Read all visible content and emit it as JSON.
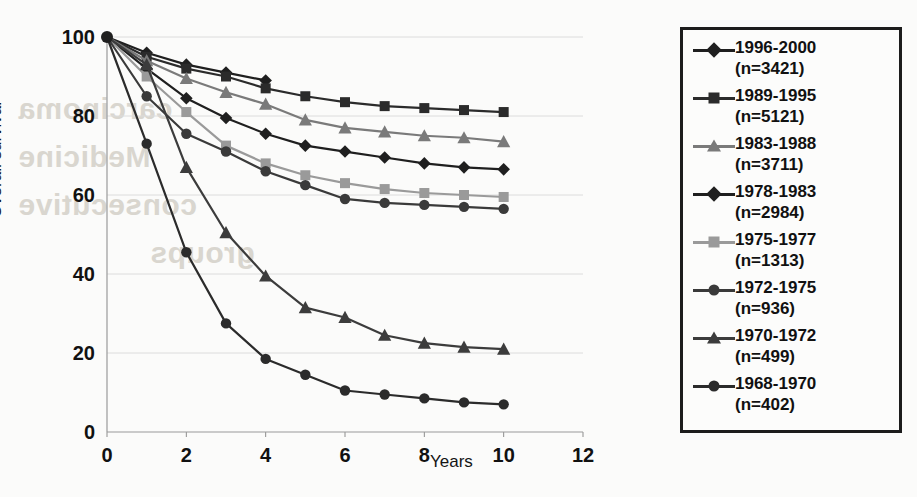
{
  "chart_data": {
    "type": "line",
    "title": "",
    "xlabel": "Years",
    "ylabel": "Overall survival",
    "xlim": [
      0,
      12
    ],
    "ylim": [
      0,
      100
    ],
    "xticks": [
      "0",
      "2",
      "4",
      "6",
      "8",
      "10",
      "12"
    ],
    "yticks": [
      "0",
      "20",
      "40",
      "60",
      "80",
      "100"
    ],
    "grid": true,
    "legend_position": "right-outside",
    "series": [
      {
        "name": "1996-2000",
        "n_label": "(n=3421)",
        "marker": "diamond",
        "color": "#1f1f1f",
        "x": [
          0,
          1,
          2,
          3,
          4
        ],
        "values": [
          100,
          96,
          93,
          91,
          89
        ]
      },
      {
        "name": "1989-1995",
        "n_label": "(n=5121)",
        "marker": "square",
        "color": "#2b2b2b",
        "x": [
          0,
          1,
          2,
          3,
          4,
          5,
          6,
          7,
          8,
          9,
          10
        ],
        "values": [
          100,
          95,
          92,
          90,
          87,
          85,
          83.5,
          82.5,
          82,
          81.5,
          81
        ]
      },
      {
        "name": "1983-1988",
        "n_label": "(n=3711)",
        "marker": "triangle",
        "color": "#7a7a7a",
        "x": [
          0,
          1,
          2,
          3,
          4,
          5,
          6,
          7,
          8,
          9,
          10
        ],
        "values": [
          100,
          94,
          89.5,
          86,
          83,
          79,
          77,
          76,
          75,
          74.5,
          73.5
        ]
      },
      {
        "name": "1978-1983",
        "n_label": "(n=2984)",
        "marker": "diamond",
        "color": "#1f1f1f",
        "x": [
          0,
          1,
          2,
          3,
          4,
          5,
          6,
          7,
          8,
          9,
          10
        ],
        "values": [
          100,
          92,
          84.5,
          79.5,
          75.5,
          72.5,
          71,
          69.5,
          68,
          67,
          66.5
        ]
      },
      {
        "name": "1975-1977",
        "n_label": "(n=1313)",
        "marker": "square",
        "color": "#9a9a9a",
        "x": [
          0,
          1,
          2,
          3,
          4,
          5,
          6,
          7,
          8,
          9,
          10
        ],
        "values": [
          100,
          90,
          81,
          72.5,
          68,
          65,
          63,
          61.5,
          60.5,
          60,
          59.5
        ]
      },
      {
        "name": "1972-1975",
        "n_label": "(n=936)",
        "marker": "circle",
        "color": "#3a3a3a",
        "x": [
          0,
          1,
          2,
          3,
          4,
          5,
          6,
          7,
          8,
          9,
          10
        ],
        "values": [
          100,
          85,
          75.5,
          71,
          66,
          62.5,
          59,
          58,
          57.5,
          57,
          56.5
        ]
      },
      {
        "name": "1970-1972",
        "n_label": "(n=499)",
        "marker": "triangle",
        "color": "#3c3c3c",
        "x": [
          0,
          1,
          2,
          3,
          4,
          5,
          6,
          7,
          8,
          9,
          10
        ],
        "values": [
          100,
          93,
          67,
          50.5,
          39.5,
          31.5,
          29,
          24.5,
          22.5,
          21.5,
          21
        ]
      },
      {
        "name": "1968-1970",
        "n_label": "(n=402)",
        "marker": "circle",
        "color": "#2b2b2b",
        "x": [
          0,
          1,
          2,
          3,
          4,
          5,
          6,
          7,
          8,
          9,
          10
        ],
        "values": [
          100,
          73,
          45.5,
          27.5,
          18.5,
          14.5,
          10.5,
          9.5,
          8.5,
          7.5,
          7
        ]
      }
    ]
  },
  "background_ghost_text": {
    "line1": "carcinoma",
    "line2": "Medicine",
    "line3": "consecutive",
    "line4": "groups"
  }
}
